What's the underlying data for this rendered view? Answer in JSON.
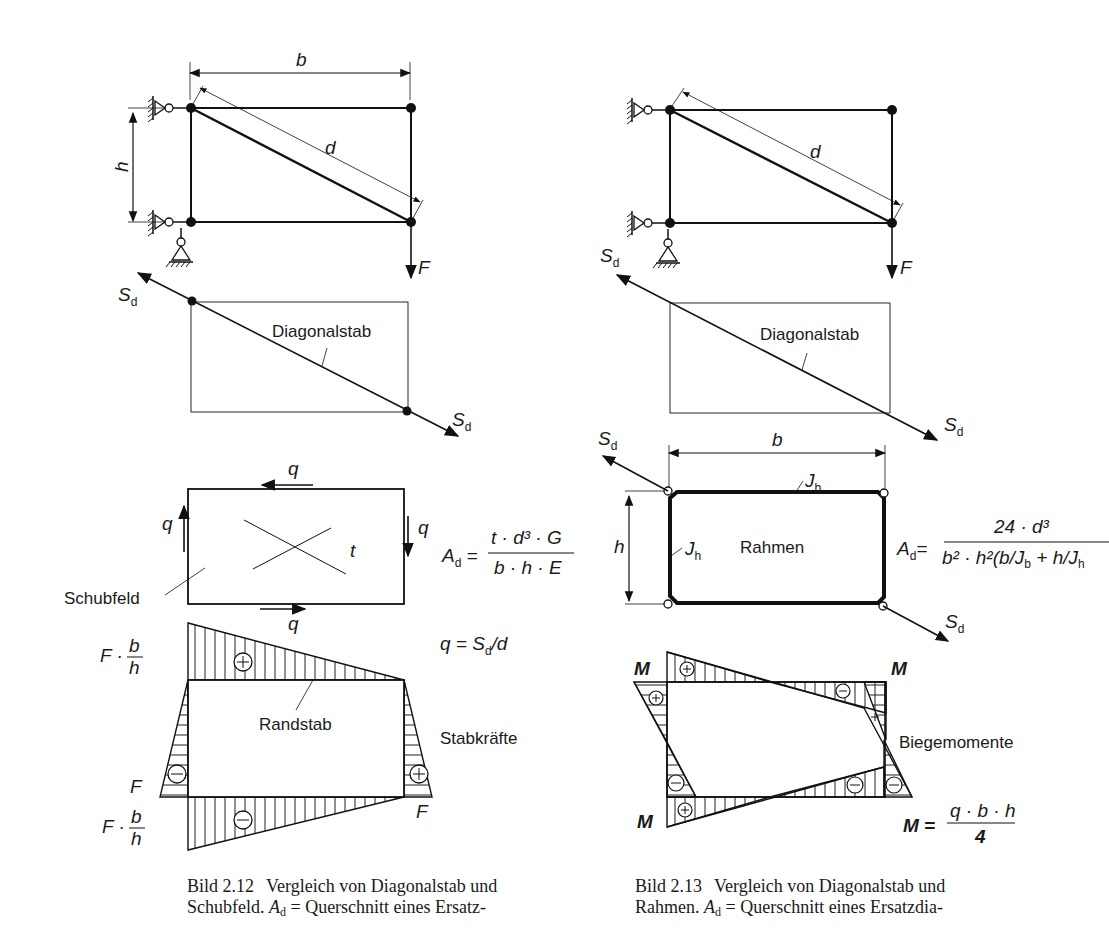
{
  "figure_left": {
    "dimensions": {
      "width": "b",
      "height": "h",
      "diagonal": "d"
    },
    "load": "F",
    "diagonal_force": "S_d",
    "diagonal_member_label": "Diagonalstab",
    "shear_field": {
      "label": "Schubfeld",
      "shear_flow": "q",
      "thickness": "t",
      "formula_lhs": "A",
      "formula_lhs_sub": "d",
      "formula_num": "t · d³ · G",
      "formula_den": "b · h · E",
      "q_formula_lhs": "q = S",
      "q_formula_sub": "d",
      "q_formula_rhs": "/d"
    },
    "bar_forces": {
      "title": "Stabkräfte",
      "edge_member_label": "Randstab",
      "top_value": "F · b/h",
      "bottom_value": "F · b/h",
      "side_value": "F",
      "signs": {
        "top": "+",
        "bottom": "−",
        "left": "−",
        "right": "+"
      }
    },
    "caption": {
      "number": "Bild 2.12",
      "line1": "Vergleich von Diagonalstab und",
      "line2_a": "Schubfeld.",
      "line2_sym": "A",
      "line2_sub": "d",
      "line2_b": "= Querschnitt eines Ersatz-"
    }
  },
  "figure_right": {
    "dimensions": {
      "width": "b",
      "height": "h",
      "diagonal": "d"
    },
    "load": "F",
    "diagonal_force": "S_d",
    "diagonal_member_label": "Diagonalstab",
    "frame": {
      "label": "Rahmen",
      "inertia_top": "J",
      "inertia_top_sub": "b",
      "inertia_side": "J",
      "inertia_side_sub": "h",
      "formula_lhs": "A",
      "formula_lhs_sub": "d",
      "formula_num": "24 · d³",
      "formula_den": "b² · h²(b/J_b + h/J_h)"
    },
    "moments": {
      "title": "Biegemomente",
      "corner_label": "M",
      "formula_lhs": "M =",
      "formula_num": "q · b · h",
      "formula_den": "4"
    },
    "caption": {
      "number": "Bild 2.13",
      "line1": "Vergleich von Diagonalstab und",
      "line2_a": "Rahmen.",
      "line2_sym": "A",
      "line2_sub": "d",
      "line2_b": "= Querschnitt eines Ersatzdia-"
    }
  }
}
